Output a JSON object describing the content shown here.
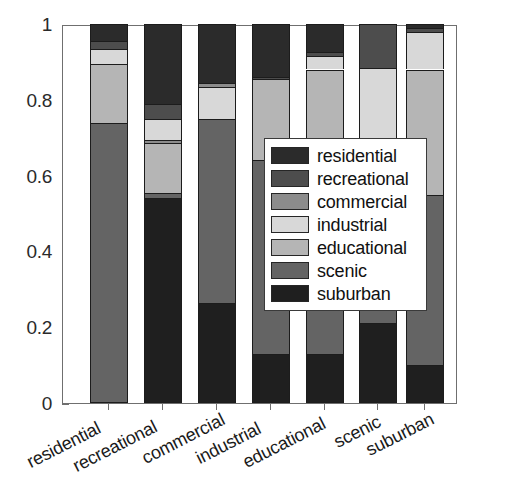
{
  "chart_data": {
    "type": "bar",
    "subtype": "stacked-bar-normalized",
    "title": "",
    "subtitle": "",
    "xlabel": "",
    "ylabel": "",
    "ylim": [
      0,
      1
    ],
    "yticks": [
      "0",
      "0.2",
      "0.4",
      "0.6",
      "0.8",
      "1"
    ],
    "ytick_values": [
      0,
      0.2,
      0.4,
      0.6,
      0.8,
      1
    ],
    "grid": false,
    "legend_position": "center",
    "categories": [
      "residential",
      "recreational",
      "commercial",
      "industrial",
      "educational",
      "scenic",
      "suburban"
    ],
    "series": [
      {
        "name": "residential",
        "color": "#2b2b2b",
        "values": [
          0.045,
          0.21,
          0.155,
          0.14,
          0.075,
          0.0,
          0.01
        ]
      },
      {
        "name": "recreational",
        "color": "#4d4d4d",
        "values": [
          0.02,
          0.04,
          0.0,
          0.005,
          0.01,
          0.115,
          0.01
        ]
      },
      {
        "name": "commercial",
        "color": "#8c8c8c",
        "values": [
          0.0,
          0.01,
          0.01,
          0.0,
          0.0,
          0.0,
          0.0
        ]
      },
      {
        "name": "industrial",
        "color": "#d8d8d8",
        "values": [
          0.04,
          0.055,
          0.085,
          0.0,
          0.035,
          0.215,
          0.1
        ]
      },
      {
        "name": "educational",
        "color": "#b5b5b5",
        "values": [
          0.155,
          0.13,
          0.0,
          0.215,
          0.28,
          0.01,
          0.33
        ]
      },
      {
        "name": "scenic",
        "color": "#646464",
        "values": [
          0.74,
          0.015,
          0.485,
          0.51,
          0.47,
          0.45,
          0.45
        ]
      },
      {
        "name": "suburban",
        "color": "#1f1f1f",
        "values": [
          0.0,
          0.54,
          0.265,
          0.13,
          0.13,
          0.21,
          0.1
        ]
      }
    ],
    "legend_entries": [
      {
        "label": "residential",
        "color": "#2b2b2b"
      },
      {
        "label": "recreational",
        "color": "#4d4d4d"
      },
      {
        "label": "commercial",
        "color": "#8c8c8c"
      },
      {
        "label": "industrial",
        "color": "#d8d8d8"
      },
      {
        "label": "educational",
        "color": "#b5b5b5"
      },
      {
        "label": "scenic",
        "color": "#646464"
      },
      {
        "label": "suburban",
        "color": "#1f1f1f"
      }
    ],
    "bars": [
      {
        "category": "residential",
        "segments": [
          {
            "name": "scenic",
            "value": 0.74,
            "color": "#646464"
          },
          {
            "name": "educational",
            "value": 0.155,
            "color": "#b5b5b5"
          },
          {
            "name": "industrial",
            "value": 0.04,
            "color": "#d8d8d8"
          },
          {
            "name": "recreational",
            "value": 0.02,
            "color": "#4d4d4d"
          },
          {
            "name": "residential",
            "value": 0.045,
            "color": "#2b2b2b"
          }
        ]
      },
      {
        "category": "recreational",
        "segments": [
          {
            "name": "suburban",
            "value": 0.54,
            "color": "#1f1f1f"
          },
          {
            "name": "scenic",
            "value": 0.015,
            "color": "#646464"
          },
          {
            "name": "educational",
            "value": 0.13,
            "color": "#b5b5b5"
          },
          {
            "name": "commercial",
            "value": 0.01,
            "color": "#8c8c8c"
          },
          {
            "name": "industrial",
            "value": 0.055,
            "color": "#d8d8d8"
          },
          {
            "name": "recreational",
            "value": 0.04,
            "color": "#4d4d4d"
          },
          {
            "name": "residential",
            "value": 0.21,
            "color": "#2b2b2b"
          }
        ]
      },
      {
        "category": "commercial",
        "segments": [
          {
            "name": "suburban",
            "value": 0.265,
            "color": "#1f1f1f"
          },
          {
            "name": "scenic",
            "value": 0.485,
            "color": "#646464"
          },
          {
            "name": "industrial",
            "value": 0.085,
            "color": "#d8d8d8"
          },
          {
            "name": "commercial",
            "value": 0.01,
            "color": "#8c8c8c"
          },
          {
            "name": "residential",
            "value": 0.155,
            "color": "#2b2b2b"
          }
        ]
      },
      {
        "category": "industrial",
        "segments": [
          {
            "name": "suburban",
            "value": 0.13,
            "color": "#1f1f1f"
          },
          {
            "name": "scenic",
            "value": 0.51,
            "color": "#646464"
          },
          {
            "name": "educational",
            "value": 0.215,
            "color": "#b5b5b5"
          },
          {
            "name": "recreational",
            "value": 0.005,
            "color": "#4d4d4d"
          },
          {
            "name": "residential",
            "value": 0.14,
            "color": "#2b2b2b"
          }
        ]
      },
      {
        "category": "educational",
        "segments": [
          {
            "name": "suburban",
            "value": 0.13,
            "color": "#1f1f1f"
          },
          {
            "name": "scenic",
            "value": 0.47,
            "color": "#646464"
          },
          {
            "name": "educational",
            "value": 0.28,
            "color": "#b5b5b5"
          },
          {
            "name": "industrial",
            "value": 0.035,
            "color": "#d8d8d8"
          },
          {
            "name": "recreational",
            "value": 0.01,
            "color": "#4d4d4d"
          },
          {
            "name": "residential",
            "value": 0.075,
            "color": "#2b2b2b"
          }
        ]
      },
      {
        "category": "scenic",
        "segments": [
          {
            "name": "suburban",
            "value": 0.21,
            "color": "#1f1f1f"
          },
          {
            "name": "scenic",
            "value": 0.45,
            "color": "#646464"
          },
          {
            "name": "educational",
            "value": 0.01,
            "color": "#b5b5b5"
          },
          {
            "name": "industrial",
            "value": 0.215,
            "color": "#d8d8d8"
          },
          {
            "name": "recreational",
            "value": 0.115,
            "color": "#4d4d4d"
          }
        ]
      },
      {
        "category": "suburban",
        "segments": [
          {
            "name": "suburban",
            "value": 0.1,
            "color": "#1f1f1f"
          },
          {
            "name": "scenic",
            "value": 0.45,
            "color": "#646464"
          },
          {
            "name": "educational",
            "value": 0.33,
            "color": "#b5b5b5"
          },
          {
            "name": "industrial",
            "value": 0.1,
            "color": "#d8d8d8"
          },
          {
            "name": "recreational",
            "value": 0.01,
            "color": "#4d4d4d"
          },
          {
            "name": "residential",
            "value": 0.01,
            "color": "#2b2b2b"
          }
        ]
      }
    ]
  }
}
